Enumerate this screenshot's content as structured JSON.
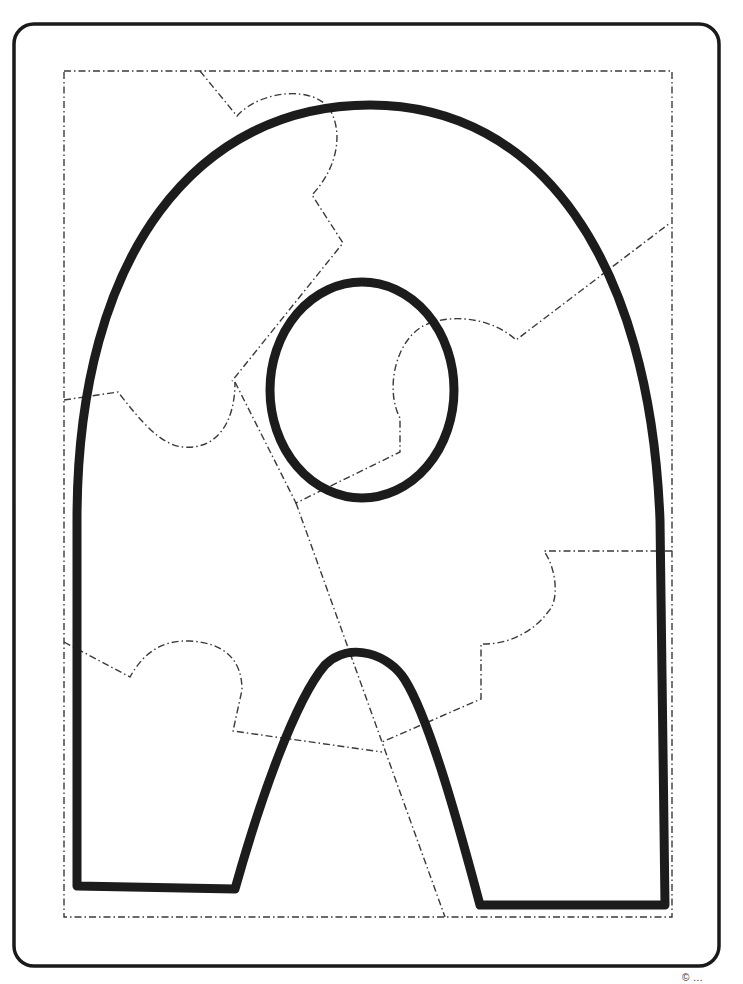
{
  "worksheet": {
    "type": "letter puzzle coloring page",
    "letter": "A",
    "pieces": 6,
    "colors": {
      "frame": "#1a1a1a",
      "letter_outline": "#1c1c1c",
      "cut_lines": "#3a3a3a",
      "background": "#ffffff"
    }
  },
  "footer": {
    "credit_text": "© ...",
    "note": "credit text is cropped at bottom edge and not legible"
  }
}
